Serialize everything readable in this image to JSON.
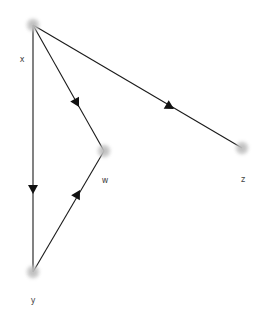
{
  "figure": {
    "kind": "directed-graph-plot",
    "width": 263,
    "height": 315,
    "background_color": "#ffffff",
    "node_color": "#c9c9c9",
    "edge_color": "#1a1a1a",
    "label_color": "#444444"
  },
  "graph": {
    "directed": true,
    "node_count": 4,
    "edge_count": 4,
    "nodes": [
      {
        "id": "x",
        "label": "x",
        "x": 33,
        "y": 25,
        "r": 6.5,
        "label_x": 22,
        "label_y": 62
      },
      {
        "id": "w",
        "label": "w",
        "x": 104,
        "y": 151,
        "r": 6.5,
        "label_x": 105,
        "label_y": 183
      },
      {
        "id": "y",
        "label": "y",
        "x": 33,
        "y": 272,
        "r": 6.5,
        "label_x": 33,
        "label_y": 303
      },
      {
        "id": "z",
        "label": "z",
        "x": 242,
        "y": 148,
        "r": 6.5,
        "label_x": 243,
        "label_y": 182
      }
    ],
    "edges": [
      {
        "id": "x-y",
        "source": "x",
        "target": "y",
        "arrow_x": 33,
        "arrow_y": 192,
        "arrow_angle": 90
      },
      {
        "id": "x-w",
        "source": "x",
        "target": "w",
        "arrow_x": 78,
        "arrow_y": 105,
        "arrow_angle": 61
      },
      {
        "id": "x-z",
        "source": "x",
        "target": "z",
        "arrow_x": 172,
        "arrow_y": 108,
        "arrow_angle": 30
      },
      {
        "id": "y-w",
        "source": "y",
        "target": "w",
        "arrow_x": 78,
        "arrow_y": 193,
        "arrow_angle": -60
      }
    ]
  },
  "top_partial_label": {
    "text": "",
    "x": 33,
    "y": 4
  }
}
